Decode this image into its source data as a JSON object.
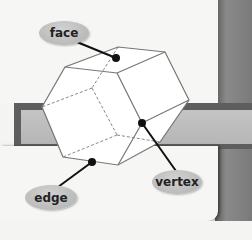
{
  "diagram": {
    "labels": [
      {
        "id": "face",
        "text": "face"
      },
      {
        "id": "edge",
        "text": "edge"
      },
      {
        "id": "vertex",
        "text": "vertex"
      }
    ],
    "colors": {
      "label_fill": "#bdbdbd",
      "line": "#777777",
      "pointer": "#111111",
      "band": "#5e5e5e",
      "band_inner": "#bebebe",
      "background": "#f6f6f4"
    }
  }
}
